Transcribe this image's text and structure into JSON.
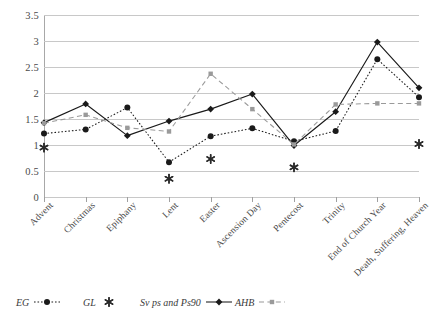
{
  "chart_data": {
    "type": "line",
    "title": "",
    "subtitle": "",
    "xlabel": "",
    "ylabel": "",
    "ylim": [
      0,
      3.5
    ],
    "ytick_step": 0.5,
    "yticks": [
      "0",
      "0.5",
      "1",
      "1.5",
      "2",
      "2.5",
      "3",
      "3.5"
    ],
    "grid": true,
    "legend_position": "bottom",
    "categories": [
      "Advent",
      "Christmas",
      "Epiphany",
      "Lent",
      "Easter",
      "Ascension Day",
      "Pentecost",
      "Trinity",
      "End of Church Year",
      "Death, Suffering, Heaven"
    ],
    "series": [
      {
        "name": "EG",
        "marker": "circle",
        "line": "dotted",
        "color": "#1a1a1a",
        "values": [
          1.22,
          1.3,
          1.72,
          0.67,
          1.17,
          1.32,
          1.07,
          1.27,
          2.65,
          1.92
        ]
      },
      {
        "name": "GL",
        "marker": "asterisk",
        "line": "none",
        "color": "#2a2a2a",
        "values": [
          0.95,
          null,
          null,
          0.35,
          0.73,
          null,
          0.57,
          null,
          null,
          1.02
        ]
      },
      {
        "name": "Sv ps and Ps90",
        "marker": "diamond",
        "line": "solid",
        "color": "#1a1a1a",
        "values": [
          1.43,
          1.79,
          1.18,
          1.46,
          1.69,
          1.98,
          0.99,
          1.64,
          2.98,
          2.1
        ]
      },
      {
        "name": "AHB",
        "marker": "square",
        "line": "dashed",
        "color": "#9a9a9a",
        "values": [
          1.42,
          1.58,
          1.33,
          1.26,
          2.37,
          1.69,
          1.01,
          1.78,
          1.8,
          1.8
        ]
      }
    ]
  },
  "legend": {
    "items": [
      {
        "label": "EG",
        "key": "circle-dotted"
      },
      {
        "label": "GL",
        "key": "asterisk"
      },
      {
        "label": "Sv ps and Ps90",
        "key": "diamond-solid"
      },
      {
        "label": "AHB",
        "key": "square-dashed"
      }
    ]
  }
}
